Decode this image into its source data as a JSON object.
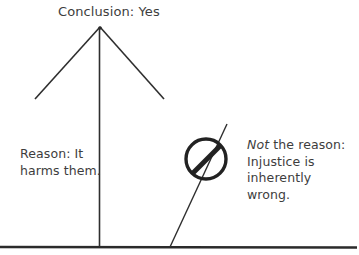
{
  "diagram": {
    "conclusion": {
      "label": "Conclusion: Yes"
    },
    "supporting_reason": {
      "line1": "Reason: It",
      "line2": "harms them."
    },
    "rejected_reason": {
      "emphasis": "Not",
      "line1_rest": " the reason:",
      "line2": "Injustice is",
      "line3": "inherently",
      "line4": "wrong.",
      "symbol": "prohibition-icon"
    },
    "colors": {
      "stroke": "#2b2b2b",
      "text": "#3d3d3d",
      "background": "#ffffff"
    }
  }
}
